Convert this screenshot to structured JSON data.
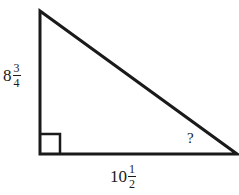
{
  "diagram": {
    "type": "right-triangle",
    "stroke_color": "#1a1a1a",
    "vertices": {
      "top": [
        40,
        10
      ],
      "right_angle": [
        40,
        154
      ],
      "bottom_right": [
        238,
        154
      ]
    },
    "right_angle_marker": true,
    "labels": {
      "vertical_leg": {
        "whole": "8",
        "numerator": "3",
        "denominator": "4"
      },
      "horizontal_leg": {
        "whole": "10",
        "numerator": "1",
        "denominator": "2"
      },
      "unknown_angle": "?"
    }
  }
}
